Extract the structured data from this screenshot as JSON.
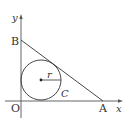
{
  "diagram": {
    "labels": {
      "y_axis": "y",
      "x_axis": "x",
      "origin": "O",
      "point_a": "A",
      "point_b": "B",
      "circle": "C",
      "radius": "r"
    },
    "colors": {
      "stroke": "#333333",
      "axis": "#555555",
      "background": "#ffffff"
    }
  }
}
